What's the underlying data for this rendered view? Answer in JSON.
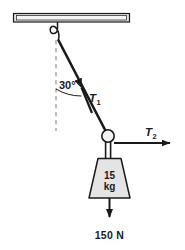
{
  "figure": {
    "type": "free-body-diagram",
    "background_color": "#ffffff",
    "line_color": "#1a1a1a",
    "fill_color": "#e8e8e8",
    "dash_color": "#8a8a8a"
  },
  "ceiling": {
    "name": "ceiling-beam",
    "fill": "#e2e2e2",
    "stroke": "#1a1a1a",
    "x": 13,
    "y": 13,
    "width": 117,
    "height": 9
  },
  "hook": {
    "name": "ceiling-hook",
    "anchor_x": 56,
    "anchor_y": 22,
    "tip_x": 58,
    "tip_y": 40
  },
  "vertical_reference": {
    "name": "vertical-dashed-line",
    "x": 56,
    "y_top": 40,
    "y_bottom": 131,
    "style": "dashed"
  },
  "angle": {
    "label": "30°",
    "value": 30,
    "unit": "degrees",
    "measured_from": "vertical",
    "label_x": 59,
    "label_y": 89,
    "arc_radius": 48
  },
  "tension_1": {
    "label": "T",
    "subscript": "1",
    "label_x": 90,
    "label_y": 101,
    "arrow_from_x": 108,
    "arrow_from_y": 135,
    "arrow_to_x": 59,
    "arrow_to_y": 41,
    "direction": "up-left toward hook"
  },
  "tension_2": {
    "label": "T",
    "subscript": "2",
    "label_x": 146,
    "label_y": 136,
    "arrow_from_x": 115,
    "arrow_from_y": 143,
    "arrow_to_x": 178,
    "arrow_to_y": 143,
    "direction": "horizontal right"
  },
  "knot": {
    "name": "rope-junction-knot",
    "cx": 108,
    "cy": 136,
    "r": 6.2,
    "fill": "#f2f2f2"
  },
  "hanging_rope": {
    "name": "hanging-rope",
    "x_left": 105.5,
    "x_right": 110.5,
    "y_top": 142,
    "y_bottom": 158
  },
  "weight_block": {
    "name": "weight-block",
    "mass_value": "15",
    "mass_unit": "kg",
    "shape": "trapezoid",
    "top_left_x": 98,
    "top_right_x": 121,
    "bottom_left_x": 89,
    "bottom_right_x": 130,
    "top_y": 158,
    "bottom_y": 198,
    "fill": "#e4e4e4",
    "text_x": 109,
    "mass_value_y": 176,
    "mass_unit_y": 188
  },
  "weight_force": {
    "label": "150 N",
    "value": 150,
    "unit": "N",
    "arrow_from_x": 109,
    "arrow_from_y": 198,
    "arrow_to_x": 109,
    "arrow_to_y": 224,
    "direction": "downward",
    "label_x": 109,
    "label_y": 239
  }
}
